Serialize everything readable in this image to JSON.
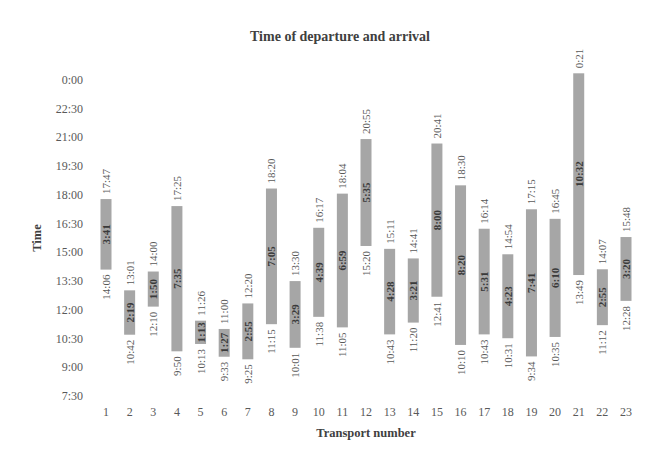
{
  "chart_data": {
    "type": "bar",
    "subtype": "floating-range",
    "title": "Time of departure and arrival",
    "xlabel": "Transport number",
    "ylabel": "Time",
    "y_ticks": [
      "0:00",
      "22:30",
      "21:00",
      "19:30",
      "18:00",
      "16:30",
      "15:00",
      "13:30",
      "12:00",
      "10:30",
      "9:00",
      "7:30"
    ],
    "ylim": [
      "7:30",
      "24:00"
    ],
    "grid": false,
    "legend": null,
    "bar_color": "#a6a6a6",
    "categories": [
      "1",
      "2",
      "3",
      "4",
      "5",
      "6",
      "7",
      "8",
      "9",
      "10",
      "11",
      "12",
      "13",
      "14",
      "15",
      "16",
      "17",
      "18",
      "19",
      "20",
      "21",
      "22",
      "23"
    ],
    "series": [
      {
        "name": "Departure",
        "values": [
          "14:06",
          "10:42",
          "12:10",
          "9:50",
          "10:13",
          "9:33",
          "9:25",
          "11:15",
          "10:01",
          "11:38",
          "11:05",
          "15:20",
          "10:43",
          "11:20",
          "12:41",
          "10:10",
          "10:43",
          "10:31",
          "9:34",
          "10:35",
          "13:49",
          "11:12",
          "12:28"
        ]
      },
      {
        "name": "Arrival",
        "values": [
          "17:47",
          "13:01",
          "14:00",
          "17:25",
          "11:26",
          "11:00",
          "12:20",
          "18:20",
          "13:30",
          "16:17",
          "18:04",
          "20:55",
          "15:11",
          "14:41",
          "20:41",
          "18:30",
          "16:14",
          "14:54",
          "17:15",
          "16:45",
          "0:21",
          "14:07",
          "15:48"
        ]
      },
      {
        "name": "Duration",
        "values": [
          "3:41",
          "2:19",
          "1:50",
          "7:35",
          "1:13",
          "1:27",
          "2:55",
          "7:05",
          "3:29",
          "4:39",
          "6:59",
          "5:35",
          "4:28",
          "3:21",
          "8:00",
          "8:20",
          "5:31",
          "4:23",
          "7:41",
          "6:10",
          "10:32",
          "2:55",
          "3:20"
        ]
      }
    ]
  }
}
